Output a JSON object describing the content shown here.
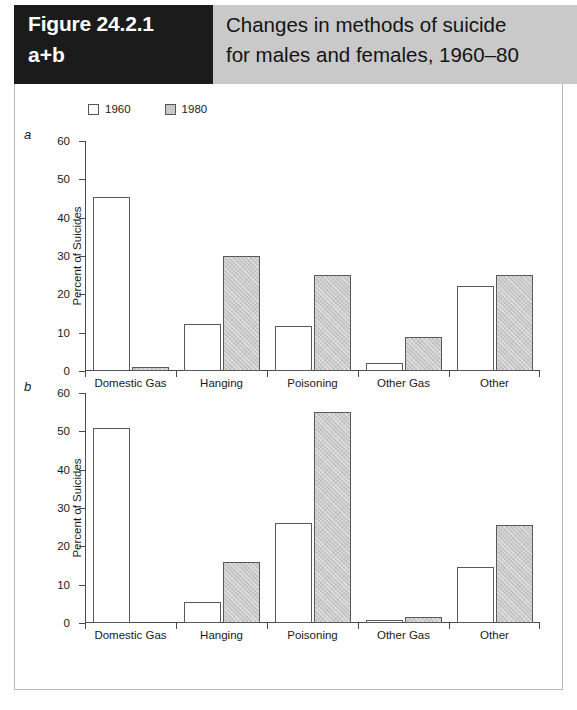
{
  "figure": {
    "number": "Figure 24.2.1",
    "sub": "a+b",
    "title_line1": "Changes in methods of suicide",
    "title_line2": "for males and females, 1960–80",
    "panel_a_letter": "a",
    "panel_b_letter": "b"
  },
  "legend": {
    "items": [
      {
        "label": "1960",
        "color": "#ffffff",
        "swatch": "legend-swatch-1960"
      },
      {
        "label": "1980",
        "color": "#c8c8c8",
        "swatch": "legend-swatch-1980"
      }
    ]
  },
  "axis": {
    "ticks": [
      "60",
      "50",
      "40",
      "30",
      "20",
      "10",
      "0"
    ],
    "ylabel": "Percent of Suicides"
  },
  "chart_data": [
    {
      "type": "bar",
      "panel": "a",
      "title": "Changes in methods of suicide for males and females, 1960–80",
      "subtitle": "a – males",
      "categories": [
        "Domestic Gas",
        "Hanging",
        "Poisoning",
        "Other Gas",
        "Other"
      ],
      "series": [
        {
          "name": "1960",
          "values": [
            45.5,
            12.3,
            11.7,
            2.0,
            22.3
          ]
        },
        {
          "name": "1980",
          "values": [
            1.0,
            30.0,
            25.0,
            9.0,
            25.0
          ]
        }
      ],
      "xlabel": "",
      "ylabel": "Percent of Suicides",
      "ylim": [
        0,
        60
      ],
      "ytick_step": 10,
      "grid": false,
      "legend_position": "top-left"
    },
    {
      "type": "bar",
      "panel": "b",
      "subtitle": "b – females",
      "categories": [
        "Domestic Gas",
        "Hanging",
        "Poisoning",
        "Other Gas",
        "Other"
      ],
      "series": [
        {
          "name": "1960",
          "values": [
            51.0,
            5.5,
            26.0,
            0.8,
            14.5
          ]
        },
        {
          "name": "1980",
          "values": [
            0.0,
            16.0,
            55.0,
            1.5,
            25.5
          ]
        }
      ],
      "xlabel": "",
      "ylabel": "Percent of Suicides",
      "ylim": [
        0,
        60
      ],
      "ytick_step": 10,
      "grid": false,
      "legend_position": "top-left"
    }
  ]
}
